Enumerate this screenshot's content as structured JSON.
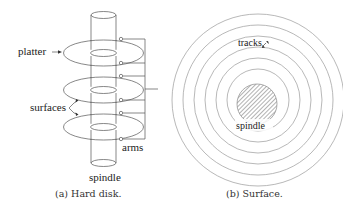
{
  "figure_a": {
    "caption": "(a) Hard disk.",
    "labels": {
      "platter": "platter",
      "surfaces": "surfaces",
      "spindle": "spindle",
      "arms": "arms"
    },
    "platter_count": 3
  },
  "figure_b": {
    "caption": "(b) Surface.",
    "labels": {
      "tracks": "tracks",
      "spindle": "spindle"
    },
    "track_count": 6
  },
  "colors": {
    "stroke": "#555555",
    "track_stroke": "#9a9a9a",
    "text": "#222222",
    "background": "#ffffff"
  }
}
